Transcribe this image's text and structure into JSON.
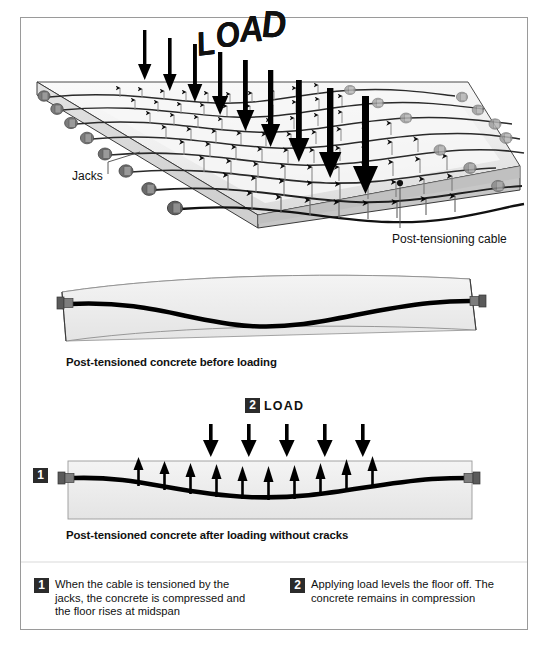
{
  "figure": {
    "kind": "post-tensioned-concrete-diagram",
    "border_color": "#9a9a9a",
    "background": "#ffffff"
  },
  "panel_top": {
    "name": "3d-slab-panel",
    "load_word": "LOAD",
    "load_letters": [
      "L",
      "O",
      "A",
      "D"
    ],
    "jacks_label": "Jacks",
    "cable_label": "Post-tensioning cable",
    "load_arrow_count": 9,
    "cable_row_count": 8,
    "slab_fill_top": "#f2f2f2",
    "slab_fill_side": "#c9c9c9",
    "jack_color": "#6f6f6f"
  },
  "panel_middle": {
    "name": "beam-before-loading",
    "caption": "Post-tensioned concrete before loading",
    "beam_fill": "#ececec",
    "cable_color": "#000000"
  },
  "panel_bottom": {
    "name": "beam-after-loading",
    "caption": "Post-tensioned concrete after loading without cracks",
    "load_badge": "2",
    "load_word": "LOAD",
    "anchor_badge": "1",
    "down_arrow_count": 5,
    "up_arrow_count": 10,
    "beam_fill": "#ececec"
  },
  "legend": {
    "items": [
      {
        "number": "1",
        "text": "When the cable is tensioned by the jacks, the concrete is compressed and the floor rises at midspan"
      },
      {
        "number": "2",
        "text": "Applying load levels the floor off. The concrete remains in compression"
      }
    ]
  },
  "colors": {
    "badge_bg": "#2b2b2b",
    "badge_text": "#ffffff",
    "ink": "#111111",
    "border": "#9a9a9a"
  }
}
